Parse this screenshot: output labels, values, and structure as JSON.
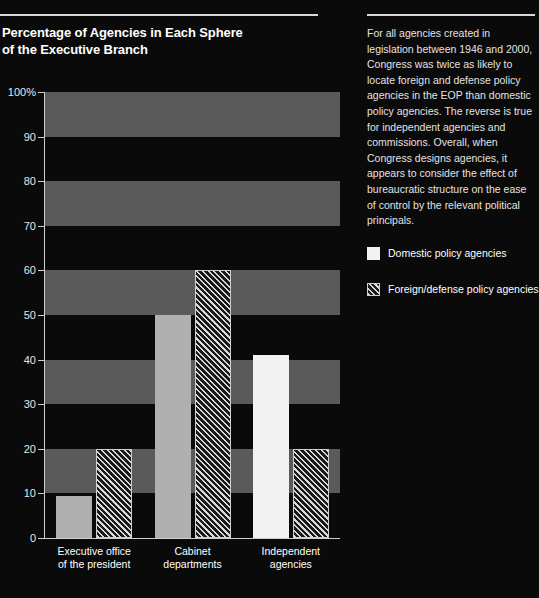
{
  "chart_data": {
    "type": "bar",
    "title": "Percentage of Agencies in Each Sphere\nof the Executive Branch",
    "xlabel": "",
    "ylabel": "",
    "ylim": [
      0,
      100
    ],
    "yticks": [
      "0",
      "10",
      "20",
      "30",
      "40",
      "50",
      "60",
      "70",
      "80",
      "90",
      "100%"
    ],
    "ytick_values": [
      0,
      10,
      20,
      30,
      40,
      50,
      60,
      70,
      80,
      90,
      100
    ],
    "grid": "horizontal alternating shaded bands (10-20, 30-40, 50-60, 70-80, 90-100)",
    "legend_position": "right",
    "categories": [
      "Executive office\nof the president",
      "Cabinet\ndepartments",
      "Independent\nagencies"
    ],
    "series": [
      {
        "name": "Domestic policy agencies",
        "style": "solid",
        "values": [
          9.5,
          50,
          41
        ]
      },
      {
        "name": "Foreign/defense policy agencies",
        "style": "diagonal-hatch",
        "values": [
          20,
          60,
          20
        ]
      }
    ]
  },
  "side_panel": {
    "note": "For all agencies created in legislation between 1946 and 2000, Congress was twice as likely to locate foreign and defense policy agencies in the EOP than domestic policy agencies. The reverse is true for independent agencies and commissions. Overall, when Congress designs agencies, it appears to consider the effect of bureaucratic structure on the ease of control by the relevant political principals.",
    "legend": [
      {
        "label": "Domestic policy agencies",
        "swatch": "solid-white-square-icon"
      },
      {
        "label": "Foreign/defense policy agencies",
        "swatch": "diagonal-hatch-square-icon"
      }
    ]
  },
  "colors": {
    "background": "#0a0a0a",
    "band": "#5a5a5a",
    "rule": "#d8d8d8",
    "bar_solid_grey": "#b0b0b0",
    "bar_solid_white": "#f2f2f2",
    "hatch_line": "#d9d9d9",
    "axis": "#cfcfcf",
    "text": "#ffffff"
  }
}
